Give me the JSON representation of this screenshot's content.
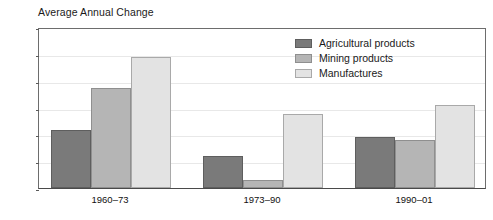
{
  "chart_data": {
    "type": "bar",
    "title": "Average Annual Change",
    "xlabel": "",
    "ylabel": "",
    "ylim": [
      0,
      12
    ],
    "yticks": [
      0,
      2,
      4,
      6,
      8,
      10,
      12
    ],
    "grid": true,
    "legend_position": "top-right",
    "categories": [
      "1960–73",
      "1973–90",
      "1990–01"
    ],
    "series": [
      {
        "name": "Agricultural products",
        "color": "#7a7a7a",
        "values": [
          4.3,
          2.4,
          3.8
        ]
      },
      {
        "name": "Mining products",
        "color": "#b5b5b5",
        "values": [
          7.45,
          0.6,
          3.55
        ]
      },
      {
        "name": "Manufactures",
        "color": "#e3e3e3",
        "values": [
          9.8,
          5.55,
          6.2
        ]
      }
    ]
  },
  "legend": {
    "items": [
      {
        "label": "Agricultural products"
      },
      {
        "label": "Mining products"
      },
      {
        "label": "Manufactures"
      }
    ]
  }
}
